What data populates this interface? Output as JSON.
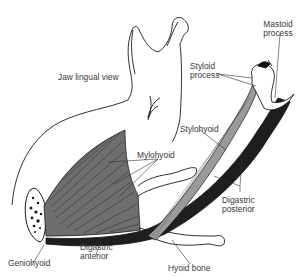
{
  "figure": {
    "view_label": "Jaw lingual view"
  },
  "labels": {
    "mastoid": {
      "line1": "Mastoid",
      "line2": "process"
    },
    "styloid": {
      "line1": "Styloid",
      "line2": "process"
    },
    "stylohyoid": "Stylohyoid",
    "mylohyoid": "Mylohyoid",
    "digastric_posterior": {
      "line1": "Digastric",
      "line2": "posterior"
    },
    "geniohyoid": "Geniohyoid",
    "digastric_anterior": {
      "line1": "Digastric",
      "line2": "anterior"
    },
    "hyoid": "Hyoid bone"
  },
  "colors": {
    "outline": "#1a1a1a",
    "mylohyoid_fill": "#6e6e6e",
    "stylohyoid_fill": "#9a9a9a",
    "digastric_fill": "#1e1e1e",
    "label_text": "#3a3a3a"
  }
}
